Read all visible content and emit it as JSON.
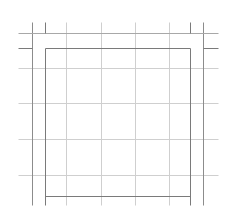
{
  "diagram": {
    "type": "grid-layout-guides",
    "canvas": {
      "width": 232,
      "height": 224,
      "background": "#ffffff"
    },
    "colors": {
      "grid": "#cfcfcf",
      "guide": "#8c8c8c",
      "frame": "#7a7a7a",
      "outer_horizontal": "#a8a8a8"
    },
    "outer_guides": {
      "vertical_x": [
        32,
        203
      ],
      "horizontal_y": [
        33
      ],
      "v_span": [
        22,
        205
      ],
      "h_span": [
        18,
        218
      ]
    },
    "frame": {
      "x1": 45,
      "y1": 48,
      "x2": 190,
      "y2": 196
    },
    "frame_stubs": {
      "top_vertical_x": [
        45,
        190
      ],
      "top_vertical_span": [
        22,
        33
      ],
      "side_horizontal_y": 48,
      "left_stub": [
        18,
        32
      ],
      "right_stub": [
        203,
        218
      ]
    },
    "grid": {
      "vertical_x": [
        66,
        101,
        135,
        169
      ],
      "horizontal_y": [
        68,
        103,
        139,
        175
      ],
      "v_span": [
        22,
        205
      ],
      "h_span": [
        18,
        218
      ]
    }
  }
}
